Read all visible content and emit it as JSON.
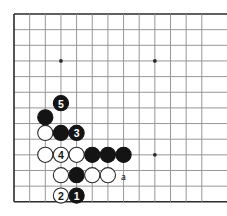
{
  "diagram": {
    "kind": "go-board-diagram",
    "board_size_shown": {
      "cols": 13,
      "rows": 13
    },
    "geometry": {
      "origin_x": 14,
      "origin_y": 14,
      "spacing": 15.65,
      "stone_radius": 7.6,
      "line_color": "#8c8c8c",
      "edge_color": "#2b2b2b",
      "black_color": "#141414",
      "white_color": "#ffffff",
      "white_stroke": "#2b2b2b",
      "label_on_black": "#ffffff",
      "label_on_white": "#141414",
      "text_color": "#141414"
    },
    "star_points": [
      {
        "col": 3,
        "row": 3
      },
      {
        "col": 9,
        "row": 3
      },
      {
        "col": 9,
        "row": 9
      }
    ],
    "stones": [
      {
        "id": "b-move-5",
        "color": "black",
        "col": 3,
        "row": 5.7,
        "label": "5"
      },
      {
        "id": "b-corner",
        "col": 2,
        "row": 6.6,
        "color": "black",
        "label": ""
      },
      {
        "id": "w-a1",
        "color": "white",
        "col": 2,
        "row": 7.6,
        "label": ""
      },
      {
        "id": "b-mid",
        "color": "black",
        "col": 3,
        "row": 7.6,
        "label": ""
      },
      {
        "id": "b-move-3",
        "color": "black",
        "col": 4,
        "row": 7.6,
        "label": "3"
      },
      {
        "id": "w-a2",
        "color": "white",
        "col": 2,
        "row": 9.0,
        "label": ""
      },
      {
        "id": "w-move-4",
        "color": "white",
        "col": 3,
        "row": 9.0,
        "label": "4"
      },
      {
        "id": "w-a3",
        "color": "white",
        "col": 4,
        "row": 9.0,
        "label": ""
      },
      {
        "id": "b-r1",
        "color": "black",
        "col": 5,
        "row": 9.0,
        "label": ""
      },
      {
        "id": "b-r2",
        "color": "black",
        "col": 6,
        "row": 9.0,
        "label": ""
      },
      {
        "id": "b-r3",
        "color": "black",
        "col": 7,
        "row": 9.0,
        "label": ""
      },
      {
        "id": "w-b1",
        "color": "white",
        "col": 3,
        "row": 10.3,
        "label": ""
      },
      {
        "id": "b-b2",
        "color": "black",
        "col": 4,
        "row": 10.3,
        "label": ""
      },
      {
        "id": "w-b3",
        "color": "white",
        "col": 5,
        "row": 10.3,
        "label": ""
      },
      {
        "id": "w-b4",
        "color": "white",
        "col": 6,
        "row": 10.3,
        "label": ""
      },
      {
        "id": "w-move-2",
        "color": "white",
        "col": 3,
        "row": 11.6,
        "label": "2"
      },
      {
        "id": "b-move-1",
        "color": "black",
        "col": 4,
        "row": 11.6,
        "label": "1"
      }
    ],
    "point_labels": [
      {
        "id": "label-a",
        "text": "a",
        "col": 7,
        "row": 10.3
      }
    ]
  }
}
